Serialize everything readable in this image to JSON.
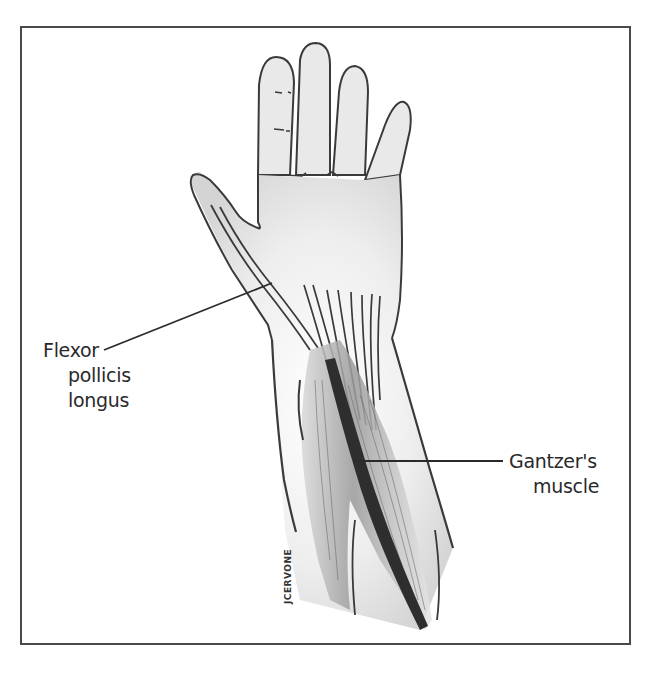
{
  "figure": {
    "labels": {
      "flexor": {
        "line1": "Flexor",
        "line2": "pollicis",
        "line3": "longus"
      },
      "gantzer": {
        "line1": "Gantzer's",
        "line2": "muscle"
      }
    },
    "signature": "JCERVONE",
    "colors": {
      "outline": "#3a3a3a",
      "frame": "#4a4a4a",
      "shading": "#cfcfcf",
      "muscle_dark": "#2e2e2e",
      "background": "#ffffff"
    }
  }
}
